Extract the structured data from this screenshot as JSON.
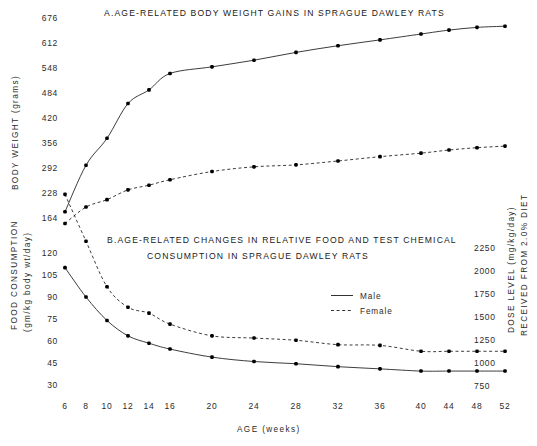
{
  "figure": {
    "width": 537,
    "height": 446,
    "background": "#ffffff",
    "ink_color": "#1a1a1a"
  },
  "legend": {
    "male_label": "Male",
    "female_label": "Female",
    "position": "center-right of panel B"
  },
  "x_axis": {
    "title": "AGE (weeks)",
    "tick_labels": [
      "6",
      "8",
      "10",
      "12",
      "14",
      "16",
      "20",
      "24",
      "28",
      "32",
      "36",
      "40",
      "44",
      "48",
      "52"
    ],
    "values": [
      6,
      8,
      10,
      12,
      14,
      16,
      20,
      24,
      28,
      32,
      36,
      40,
      44,
      48,
      52
    ],
    "spacing": "categorical-even"
  },
  "chart_data": [
    {
      "id": "panel-a",
      "type": "line",
      "title": "A.AGE-RELATED BODY WEIGHT GAINS IN SPRAGUE DAWLEY RATS",
      "xlabel": "AGE (weeks)",
      "ylabel": "BODY WEIGHT (grams)",
      "x": [
        6,
        8,
        10,
        12,
        14,
        16,
        20,
        24,
        28,
        32,
        36,
        40,
        44,
        48,
        52
      ],
      "xtick_labels": [
        "6",
        "8",
        "10",
        "12",
        "14",
        "16",
        "20",
        "24",
        "28",
        "32",
        "36",
        "40",
        "44",
        "48",
        "52"
      ],
      "ytick_labels": [
        "164",
        "228",
        "292",
        "356",
        "420",
        "484",
        "548",
        "612",
        "676"
      ],
      "yticks": [
        164,
        228,
        292,
        356,
        420,
        484,
        548,
        612,
        676
      ],
      "ylim": [
        132,
        676
      ],
      "grid": false,
      "series": [
        {
          "name": "Male",
          "style": "solid",
          "values": [
            180,
            299,
            368,
            457,
            492,
            534,
            551,
            568,
            588,
            605,
            620,
            635,
            645,
            652,
            655
          ]
        },
        {
          "name": "Female",
          "style": "dashed",
          "values": [
            150,
            192,
            211,
            236,
            248,
            262,
            283,
            295,
            300,
            310,
            321,
            330,
            338,
            344,
            348
          ]
        }
      ]
    },
    {
      "id": "panel-b",
      "type": "line",
      "title_line1": "B.AGE-RELATED CHANGES IN RELATIVE FOOD AND TEST CHEMICAL",
      "title_line2": "CONSUMPTION IN SPRAGUE DAWLEY RATS",
      "xlabel": "AGE (weeks)",
      "ylabel": "FOOD CONSUMPTION (gm/kg body wt/day)",
      "ylabel_line1": "FOOD CONSUMPTION",
      "ylabel_line2": "(gm/kg body wt/day)",
      "y2label": "DOSE LEVEL (mg/kg/day) RECEIVED FROM 2.0% DIET",
      "y2label_line1": "DOSE LEVEL (mg/kg/day)",
      "y2label_line2": "RECEIVED FROM 2.0% DIET",
      "x": [
        6,
        8,
        10,
        12,
        14,
        16,
        20,
        24,
        28,
        32,
        36,
        40,
        44,
        48,
        52
      ],
      "xtick_labels": [
        "6",
        "8",
        "10",
        "12",
        "14",
        "16",
        "20",
        "24",
        "28",
        "32",
        "36",
        "40",
        "44",
        "48",
        "52"
      ],
      "ytick_labels": [
        "30",
        "45",
        "60",
        "75",
        "90",
        "105",
        "120"
      ],
      "yticks": [
        30,
        45,
        60,
        75,
        90,
        105,
        120
      ],
      "ylim": [
        25,
        172
      ],
      "y2tick_labels": [
        "750",
        "1000",
        "1250",
        "1500",
        "1750",
        "2000",
        "2250"
      ],
      "y2ticks": [
        750,
        1000,
        1250,
        1500,
        1750,
        2000,
        2250
      ],
      "grid": false,
      "series": [
        {
          "name": "Male",
          "style": "solid",
          "values": [
            110,
            90,
            74,
            63.5,
            58.5,
            54.5,
            49,
            46,
            44.5,
            42.5,
            41,
            39.5,
            39.5,
            39.5,
            39.5
          ]
        },
        {
          "name": "Female",
          "style": "dashed",
          "values": [
            160,
            128,
            97,
            83,
            79,
            71.5,
            63.5,
            62,
            60.5,
            57.5,
            57,
            53,
            53,
            53,
            53
          ]
        }
      ]
    }
  ]
}
